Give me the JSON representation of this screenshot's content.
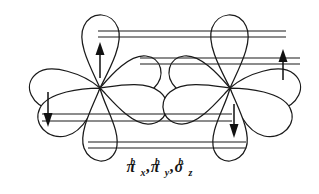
{
  "figure": {
    "name": "bonding-molecular-orbitals-diagram",
    "background_color": "#ffffff",
    "stroke_color": "#1a1a1a",
    "width": 319,
    "height": 194
  },
  "caption": {
    "full_text": "πxᵇ, πyᵇ, σzᵇ",
    "terms": [
      {
        "symbol": "π",
        "subscript": "x",
        "superscript": "b"
      },
      {
        "symbol": "π",
        "subscript": "y",
        "superscript": "b"
      },
      {
        "symbol": "σ",
        "subscript": "z",
        "superscript": "b"
      }
    ],
    "separator": ","
  },
  "atoms": [
    {
      "id": "left-atom",
      "center_x": 100,
      "center_y": 88,
      "lobes": [
        {
          "id": "left-lobe-up",
          "angle_deg": -76,
          "length": 72,
          "width": 46
        },
        {
          "id": "left-lobe-upper-right",
          "angle_deg": -26,
          "length": 64,
          "width": 40
        },
        {
          "id": "left-lobe-right",
          "angle_deg": 8,
          "length": 74,
          "width": 44
        },
        {
          "id": "left-lobe-down",
          "angle_deg": 76,
          "length": 72,
          "width": 46
        },
        {
          "id": "left-lobe-lower-left",
          "angle_deg": 158,
          "length": 70,
          "width": 42
        },
        {
          "id": "left-lobe-upper-left",
          "angle_deg": 192,
          "length": 72,
          "width": 42
        }
      ]
    },
    {
      "id": "right-atom",
      "center_x": 230,
      "center_y": 88,
      "lobes": [
        {
          "id": "right-lobe-up",
          "angle_deg": -104,
          "length": 72,
          "width": 46
        },
        {
          "id": "right-lobe-upper-left",
          "angle_deg": -154,
          "length": 64,
          "width": 40
        },
        {
          "id": "right-lobe-left",
          "angle_deg": 172,
          "length": 74,
          "width": 44
        },
        {
          "id": "right-lobe-down",
          "angle_deg": 104,
          "length": 72,
          "width": 46
        },
        {
          "id": "right-lobe-lower-right",
          "angle_deg": 22,
          "length": 70,
          "width": 42
        },
        {
          "id": "right-lobe-upper-right",
          "angle_deg": -12,
          "length": 72,
          "width": 42
        }
      ]
    }
  ],
  "bond_lines": [
    {
      "id": "bond-pair-top",
      "y_upper": 31,
      "y_lower": 37,
      "x_start": 98,
      "x_end": 286
    },
    {
      "id": "bond-pair-middle",
      "y_upper": 58,
      "y_lower": 64,
      "x_start": 140,
      "x_end": 300
    },
    {
      "id": "bond-pair-lower",
      "y_upper": 114,
      "y_lower": 121,
      "x_start": 42,
      "x_end": 232
    },
    {
      "id": "bond-pair-bottom",
      "y_upper": 142,
      "y_lower": 148,
      "x_start": 88,
      "x_end": 246
    }
  ],
  "spin_arrows": [
    {
      "id": "spin-up-left",
      "x": 100,
      "y_top": 45,
      "y_bottom": 78,
      "direction": "up",
      "label": "spin-up"
    },
    {
      "id": "spin-down-left",
      "x": 48,
      "y_top": 92,
      "y_bottom": 124,
      "direction": "down",
      "label": "spin-down"
    },
    {
      "id": "spin-up-right",
      "x": 283,
      "y_top": 52,
      "y_bottom": 80,
      "direction": "up",
      "label": "spin-up"
    },
    {
      "id": "spin-down-right",
      "x": 234,
      "y_top": 104,
      "y_bottom": 136,
      "direction": "down",
      "label": "spin-down"
    }
  ]
}
